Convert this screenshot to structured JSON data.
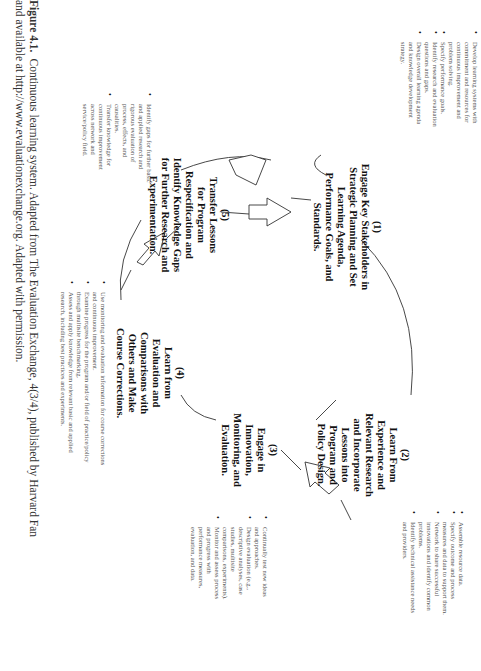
{
  "diagram": {
    "title": "Continuous learning system",
    "nodes": [
      {
        "num": "(1)",
        "lines": [
          "Engage Key Stakeholders in",
          "Strategic Planning and Set",
          "Learning Agenda,",
          "Performance Goals, and",
          "Standards."
        ]
      },
      {
        "num": "(2)",
        "lines": [
          "Learn From",
          "Experience and",
          "Relevant Research",
          "and Incorporate",
          "Lessons into",
          "Program and",
          "Policy Design."
        ]
      },
      {
        "num": "(3)",
        "lines": [
          "Engage in",
          "Innovation,",
          "Monitoring, and",
          "Evaluation."
        ]
      },
      {
        "num": "(4)",
        "lines": [
          "Learn from",
          "Evaluation and",
          "Comparisons with",
          "Others and Make",
          "Course Corrections."
        ]
      },
      {
        "num": "(5)",
        "lines": [
          "Transfer Lessons",
          "for Program",
          "Respecification and",
          "Identify Knowledge Gaps",
          "for Further Research and",
          "Experimentation."
        ]
      }
    ],
    "bullets": [
      [
        "Develop learning systems with commitment and resources for continuous improvement and problem solving.",
        "Specify performance goals.",
        "Identify research and evaluation questions and gaps.",
        "Design overall learning agenda and knowledge development strategy."
      ],
      [
        "Assemble resource data.",
        "Specify outcome and process measures and data to support them.",
        "Network to share successful innovations and identify common problems.",
        "Identify technical assistance needs and providers."
      ],
      [
        "Continually test new ideas and approaches.",
        "Design evaluation (e.g., descriptive analyses, case studies, multisite comparisons, experiments).",
        "Monitor and assess process and progress with performance measures, evaluation, and data."
      ],
      [
        "Use monitoring and evaluation information for course corrections and continuous improvement.",
        "Examine progress for the program and/or field of practice/policy through multisite benchmarking.",
        "Assess and apply knowledge from relevant basic and applied research, including best practices and experiments."
      ],
      [
        "Identify gaps for further basic and applied research and rigorous evaluation of process, effects, and causalities.",
        "Transfer knowledge for continuous improvement across network and service/policy field."
      ]
    ],
    "arrows": [
      "arrow-1-to-2",
      "arrow-2-to-3",
      "arrow-4-to-5"
    ]
  },
  "caption": {
    "label": "Figure 4.1.",
    "line1": "Continuous learning system. Adapted from The Evaluation Exchange, 4(3/4), published by Harvard Fan",
    "line2": "and available at http://www.evaluationexchange.org. Adapted with permission."
  }
}
